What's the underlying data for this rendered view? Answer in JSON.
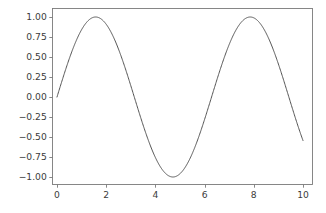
{
  "figure": {
    "width": 326,
    "height": 213,
    "background": "#ffffff"
  },
  "chart_data": {
    "type": "line",
    "title": "",
    "xlabel": "",
    "ylabel": "",
    "xlim": [
      -0.5,
      10.5
    ],
    "ylim": [
      -1.1,
      1.1
    ],
    "grid": false,
    "legend": null,
    "line_color": "#555555",
    "line_width": 1.0,
    "xticks": [
      0,
      2,
      4,
      6,
      8,
      10
    ],
    "xtick_labels": [
      "0",
      "2",
      "4",
      "6",
      "8",
      "10"
    ],
    "yticks": [
      -1.0,
      -0.75,
      -0.5,
      -0.25,
      0.0,
      0.25,
      0.5,
      0.75,
      1.0
    ],
    "ytick_labels": [
      "-1.00",
      "-0.75",
      "-0.50",
      "-0.25",
      "0.00",
      "0.25",
      "0.50",
      "0.75",
      "1.00"
    ],
    "series": [
      {
        "name": "sin(x)",
        "function": "sin",
        "x": [
          0.0,
          0.2,
          0.4,
          0.6,
          0.8,
          1.0,
          1.2,
          1.4,
          1.5708,
          1.8,
          2.0,
          2.2,
          2.4,
          2.6,
          2.8,
          3.0,
          3.1416,
          3.4,
          3.6,
          3.8,
          4.0,
          4.2,
          4.4,
          4.6,
          4.7124,
          5.0,
          5.2,
          5.4,
          5.6,
          5.8,
          6.0,
          6.2,
          6.2832,
          6.6,
          6.8,
          7.0,
          7.2,
          7.4,
          7.6,
          7.8,
          7.854,
          8.2,
          8.4,
          8.6,
          8.8,
          9.0,
          9.2,
          9.4248,
          9.6,
          9.8,
          10.0
        ],
        "y": [
          0.0,
          0.1987,
          0.3894,
          0.5646,
          0.7174,
          0.8415,
          0.932,
          0.9854,
          1.0,
          0.9738,
          0.9093,
          0.8085,
          0.6755,
          0.5155,
          0.335,
          0.1411,
          0.0,
          -0.2555,
          -0.4425,
          -0.6119,
          -0.7568,
          -0.8716,
          -0.9516,
          -0.9937,
          -1.0,
          -0.9589,
          -0.8835,
          -0.7728,
          -0.6313,
          -0.4646,
          -0.2794,
          -0.0831,
          0.0,
          0.3115,
          0.4941,
          0.657,
          0.7937,
          0.8987,
          0.9679,
          0.9989,
          1.0,
          0.9407,
          0.8546,
          0.7344,
          0.5849,
          0.4121,
          0.2229,
          0.0,
          -0.1743,
          -0.3665,
          -0.544
        ]
      }
    ]
  },
  "axes": {
    "spine_color": "#7a7a7a",
    "tick_color": "#7a7a7a",
    "tick_label_color": "#3b3b3b",
    "left_px": 52,
    "right_px": 312,
    "top_px": 8,
    "bottom_px": 184,
    "x0_px": 57,
    "x10_px": 303,
    "ytop_px": 17,
    "ybottom_px": 177
  }
}
